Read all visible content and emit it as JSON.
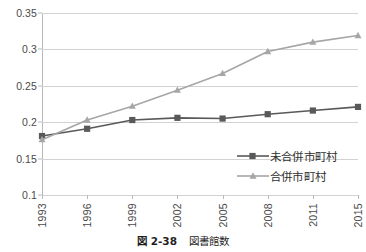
{
  "chart_data": {
    "type": "line",
    "title": "",
    "xlabel": "",
    "ylabel": "",
    "categories": [
      "1993",
      "1996",
      "1999",
      "2002",
      "2005",
      "2008",
      "2011",
      "2015"
    ],
    "series": [
      {
        "name": "未合併市町村",
        "color": "#595959",
        "marker": "square",
        "values": [
          0.181,
          0.191,
          0.203,
          0.206,
          0.205,
          0.211,
          0.216,
          0.221
        ]
      },
      {
        "name": "合併市町村",
        "color": "#a6a6a6",
        "marker": "triangle",
        "values": [
          0.176,
          0.203,
          0.222,
          0.244,
          0.267,
          0.297,
          0.31,
          0.319
        ]
      }
    ],
    "ylim": [
      0.1,
      0.35
    ],
    "ytick_labels": [
      "0.35",
      "0.3",
      "0.25",
      "0.2",
      "0.15",
      "0.1"
    ],
    "ytick_values": [
      0.35,
      0.3,
      0.25,
      0.2,
      0.15,
      0.1
    ],
    "grid": true,
    "legend_position": "inside-lower-right"
  },
  "caption": {
    "figure_number": "図 2-38",
    "figure_title": "図書館数"
  },
  "legend": {
    "items": [
      {
        "label": "未合併市町村"
      },
      {
        "label": "合併市町村"
      }
    ]
  }
}
